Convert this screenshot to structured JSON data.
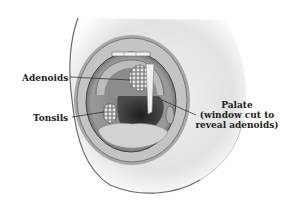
{
  "figure": {
    "labels": {
      "adenoids": "Adenoids",
      "tonsils": "Tonsils",
      "palate_line1": "Palate",
      "palate_line2": "(window cut to",
      "palate_line3": "reveal adenoids)"
    },
    "colors": {
      "background": "#ffffff",
      "skin": "#e6e6e6",
      "lip": "#b8b8b8",
      "mouth_interior": "#6a6a6a",
      "throat": "#2e2e2e",
      "tongue": "#cfcfcf",
      "label_text": "#222222"
    }
  }
}
